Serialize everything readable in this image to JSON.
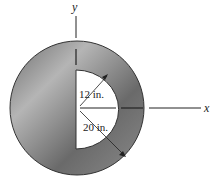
{
  "diagram": {
    "axes": {
      "x_label": "x",
      "y_label": "y"
    },
    "dimensions": {
      "inner_radius": "12 in.",
      "outer_radius": "20 in."
    },
    "colors": {
      "ring_dark": "#5a5a5a",
      "ring_light": "#b8b8b8",
      "cutout": "#ffffff",
      "line": "#222222"
    }
  }
}
